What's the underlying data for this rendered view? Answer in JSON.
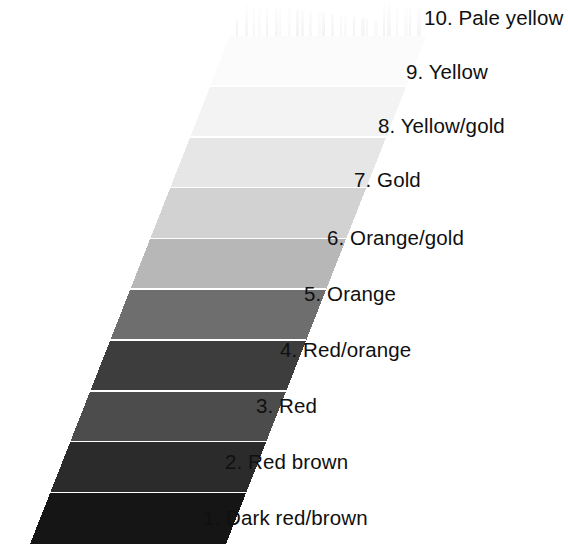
{
  "figure": {
    "name": "colour-scale-strip",
    "background_color": "#ffffff",
    "band_separator_color": "#ffffff",
    "text_color": "#101010",
    "orientation": "vertical-slanted-parallelogram",
    "note_top_texture": "feathered brush strokes above band 10"
  },
  "chart_data": {
    "type": "table",
    "title": "",
    "xlabel": "",
    "ylabel": "",
    "categories": [
      "1. Dark red/brown",
      "2. Red brown",
      "3. Red",
      "4. Red/orange",
      "5. Orange",
      "6. Orange/gold",
      "7. Gold",
      "8. Yellow/gold",
      "9. Yellow",
      "10. Pale yellow"
    ],
    "values": [
      1,
      2,
      3,
      4,
      5,
      6,
      7,
      8,
      9,
      10
    ],
    "series": [
      {
        "name": "band greyscale value",
        "values": [
          "#151515",
          "#2b2b2b",
          "#4c4c4c",
          "#3d3d3d",
          "#6e6e6e",
          "#b7b7b7",
          "#d2d2d2",
          "#e6e6e6",
          "#f3f3f3",
          "#fbfbfb"
        ]
      }
    ]
  },
  "bands": [
    {
      "number": "10",
      "name": "Pale yellow",
      "label": "10. Pale yellow",
      "color": "#fbfbfb",
      "label_left": 424,
      "label_top": 8
    },
    {
      "number": "9",
      "name": "Yellow",
      "label": "9. Yellow",
      "color": "#f3f3f3",
      "label_left": 406,
      "label_top": 62
    },
    {
      "number": "8",
      "name": "Yellow/gold",
      "label": "8. Yellow/gold",
      "color": "#e6e6e6",
      "label_left": 378,
      "label_top": 116
    },
    {
      "number": "7",
      "name": "Gold",
      "label": "7. Gold",
      "color": "#d2d2d2",
      "label_left": 354,
      "label_top": 170
    },
    {
      "number": "6",
      "name": "Orange/gold",
      "label": "6. Orange/gold",
      "color": "#b7b7b7",
      "label_left": 327,
      "label_top": 228
    },
    {
      "number": "5",
      "name": "Orange",
      "label": "5. Orange",
      "color": "#6e6e6e",
      "label_left": 304,
      "label_top": 284
    },
    {
      "number": "4",
      "name": "Red/orange",
      "label": "4. Red/orange",
      "color": "#3d3d3d",
      "label_left": 280,
      "label_top": 340
    },
    {
      "number": "3",
      "name": "Red",
      "label": "3. Red",
      "color": "#4c4c4c",
      "label_left": 256,
      "label_top": 396
    },
    {
      "number": "2",
      "name": "Red brown",
      "label": "2. Red brown",
      "color": "#2b2b2b",
      "label_left": 225,
      "label_top": 452
    },
    {
      "number": "1",
      "name": "Dark red/brown",
      "label": "1. Dark red/brown",
      "color": "#151515",
      "label_left": 203,
      "label_top": 508
    }
  ]
}
